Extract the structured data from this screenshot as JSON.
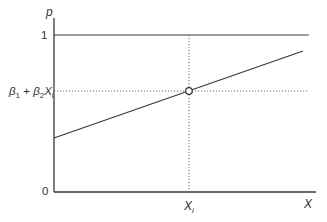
{
  "diagram": {
    "type": "linear-probability-model",
    "colors": {
      "line": "#3a3a3a",
      "dotted": "#6a6a6a",
      "text": "#333333",
      "background": "#ffffff"
    },
    "y_axis": {
      "label": "p",
      "ticks": [
        {
          "label": "1",
          "value": 1
        },
        {
          "label": "0",
          "value": 0
        }
      ]
    },
    "x_axis": {
      "label": "X",
      "tick_label_main": "X",
      "tick_label_sub": "i"
    },
    "fitted_value_label": {
      "beta1": "β",
      "beta1_sub": "1",
      "plus": " + ",
      "beta2": "β",
      "beta2_sub": "2",
      "x": "X",
      "x_sub": "i"
    },
    "elements": {
      "upper_bound_line": "p = 1",
      "regression_line": "p = β1 + β2X",
      "point": "open circle at (Xi, β1 + β2Xi)"
    }
  }
}
